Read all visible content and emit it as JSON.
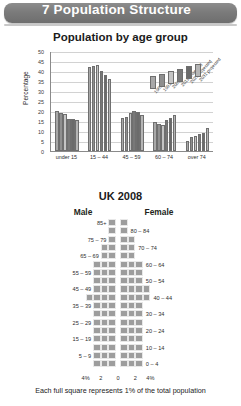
{
  "header": {
    "number": "7",
    "title": "7 Population Structure",
    "banner_color": "#7b7b7b"
  },
  "chart_data": [
    {
      "type": "bar",
      "title": "Population by age group",
      "xlabel": "",
      "ylabel": "Percentage",
      "ylim": [
        0,
        50
      ],
      "yticks": [
        0,
        5,
        10,
        15,
        20,
        25,
        30,
        35,
        40,
        45,
        50
      ],
      "grid": true,
      "legend_position": "top-right",
      "categories": [
        "under 15",
        "15 – 44",
        "45 – 59",
        "60 – 74",
        "over 74"
      ],
      "series": [
        {
          "name": "1981",
          "color": "#a8a8a8",
          "values": [
            20.0,
            42.0,
            16.5,
            14.3,
            5.0
          ]
        },
        {
          "name": "1991",
          "color": "#8f8f8f",
          "values": [
            19.2,
            42.5,
            17.0,
            13.5,
            7.0
          ]
        },
        {
          "name": "2001",
          "color": "#c4c4c4",
          "values": [
            18.7,
            43.0,
            19.0,
            12.8,
            7.5
          ]
        },
        {
          "name": "2011 projected",
          "color": "#787878",
          "values": [
            16.2,
            40.0,
            19.8,
            15.5,
            8.3
          ]
        },
        {
          "name": "2021 projected",
          "color": "#6b6b6b",
          "values": [
            16.0,
            38.0,
            19.5,
            16.5,
            9.0
          ]
        },
        {
          "name": "2031 projected",
          "color": "#b5b5b5",
          "values": [
            15.5,
            35.8,
            17.8,
            17.8,
            11.3
          ]
        }
      ]
    },
    {
      "type": "bar",
      "orientation": "pyramid",
      "title": "UK 2008",
      "male_label": "Male",
      "female_label": "Female",
      "caption": "Each full square represents 1% of the total population",
      "xlim": [
        -4,
        4
      ],
      "xticks": [
        "4%",
        "2",
        "0",
        "2",
        "4%"
      ],
      "unit_note": "square = 1% of total population",
      "age_groups": [
        {
          "label": "85+",
          "side": "left",
          "male": 0.6,
          "female": 1.3
        },
        {
          "label": "80 – 84",
          "side": "right",
          "male": 0.9,
          "female": 1.3
        },
        {
          "label": "75 – 79",
          "side": "left",
          "male": 1.3,
          "female": 1.6
        },
        {
          "label": "70 – 74",
          "side": "right",
          "male": 1.6,
          "female": 1.8
        },
        {
          "label": "65 – 69",
          "side": "left",
          "male": 1.9,
          "female": 2.1
        },
        {
          "label": "60 – 64",
          "side": "right",
          "male": 2.5,
          "female": 2.6
        },
        {
          "label": "55 – 59",
          "side": "left",
          "male": 2.6,
          "female": 2.7
        },
        {
          "label": "50 – 54",
          "side": "right",
          "male": 2.9,
          "female": 3.0
        },
        {
          "label": "45 – 49",
          "side": "left",
          "male": 3.4,
          "female": 3.5
        },
        {
          "label": "40 – 44",
          "side": "right",
          "male": 3.6,
          "female": 3.6
        },
        {
          "label": "35 – 39",
          "side": "left",
          "male": 3.4,
          "female": 3.4
        },
        {
          "label": "30 – 34",
          "side": "right",
          "male": 3.1,
          "female": 3.1
        },
        {
          "label": "25 – 29",
          "side": "left",
          "male": 3.3,
          "female": 3.2
        },
        {
          "label": "20 – 24",
          "side": "right",
          "male": 3.4,
          "female": 3.2
        },
        {
          "label": "15 – 19",
          "side": "left",
          "male": 3.3,
          "female": 3.1
        },
        {
          "label": "10 – 14",
          "side": "right",
          "male": 3.0,
          "female": 2.9
        },
        {
          "label": "5 – 9",
          "side": "left",
          "male": 2.8,
          "female": 2.7
        },
        {
          "label": "0 – 4",
          "side": "right",
          "male": 3.0,
          "female": 2.9
        }
      ]
    }
  ]
}
